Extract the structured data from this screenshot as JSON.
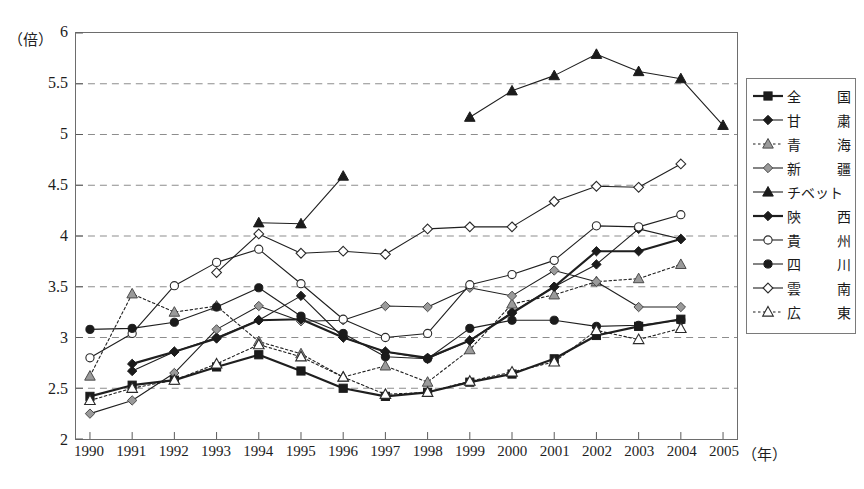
{
  "axis": {
    "y_unit_label": "（倍）",
    "x_unit_label": "（年）",
    "y_ticks": [
      "6",
      "5.5",
      "5",
      "4.5",
      "4",
      "3.5",
      "3",
      "2.5",
      "2"
    ],
    "x_ticks": [
      "1990",
      "1991",
      "1992",
      "1993",
      "1994",
      "1995",
      "1996",
      "1997",
      "1998",
      "1999",
      "2000",
      "2001",
      "2002",
      "2003",
      "2004",
      "2005"
    ]
  },
  "legend": {
    "items": [
      {
        "label": "全　国",
        "chars": [
          "全",
          "国"
        ],
        "marker": "square-filled",
        "dash": "solid",
        "weight": "bold"
      },
      {
        "label": "甘　粛",
        "chars": [
          "甘",
          "粛"
        ],
        "marker": "diamond-filled",
        "dash": "solid",
        "weight": "normal"
      },
      {
        "label": "青　海",
        "chars": [
          "青",
          "海"
        ],
        "marker": "triangle-grey",
        "dash": "dotted",
        "weight": "normal"
      },
      {
        "label": "新　疆",
        "chars": [
          "新",
          "疆"
        ],
        "marker": "diamond-grey",
        "dash": "solid",
        "weight": "normal"
      },
      {
        "label": "チベット",
        "chars": [
          "チベット"
        ],
        "marker": "triangle-filled",
        "dash": "solid",
        "weight": "normal"
      },
      {
        "label": "陝　西",
        "chars": [
          "陝",
          "西"
        ],
        "marker": "diamond-filled",
        "dash": "solid",
        "weight": "bold"
      },
      {
        "label": "貴　州",
        "chars": [
          "貴",
          "州"
        ],
        "marker": "circle-open",
        "dash": "solid",
        "weight": "normal"
      },
      {
        "label": "四　川",
        "chars": [
          "四",
          "川"
        ],
        "marker": "circle-filled",
        "dash": "solid",
        "weight": "normal"
      },
      {
        "label": "雲　南",
        "chars": [
          "雲",
          "南"
        ],
        "marker": "diamond-open",
        "dash": "solid",
        "weight": "normal"
      },
      {
        "label": "広　東",
        "chars": [
          "広",
          "東"
        ],
        "marker": "triangle-open",
        "dash": "dotted",
        "weight": "normal"
      }
    ]
  },
  "chart_data": {
    "type": "line",
    "title": "",
    "xlabel": "（年）",
    "ylabel": "（倍）",
    "xlim": [
      1990,
      2005
    ],
    "ylim": [
      2,
      6
    ],
    "ytick_step": 0.5,
    "grid": "horizontal-dashed",
    "legend_position": "right",
    "x": [
      1990,
      1991,
      1992,
      1993,
      1994,
      1995,
      1996,
      1997,
      1998,
      1999,
      2000,
      2001,
      2002,
      2003,
      2004,
      2005
    ],
    "series": [
      {
        "name": "全国",
        "marker": "square-filled",
        "dash": "solid",
        "weight": "bold",
        "values": [
          2.42,
          2.53,
          2.58,
          2.71,
          2.83,
          2.67,
          2.5,
          2.42,
          2.46,
          2.56,
          2.64,
          2.79,
          3.02,
          3.11,
          3.18,
          null
        ]
      },
      {
        "name": "甘粛",
        "marker": "diamond-filled",
        "dash": "solid",
        "weight": "normal",
        "values": [
          null,
          2.67,
          2.86,
          3.0,
          3.17,
          3.41,
          3.0,
          2.86,
          2.79,
          2.97,
          3.25,
          3.5,
          3.72,
          4.07,
          3.97,
          null
        ]
      },
      {
        "name": "青海",
        "marker": "triangle-grey",
        "dash": "dotted",
        "weight": "normal",
        "values": [
          2.62,
          3.43,
          3.25,
          3.31,
          2.96,
          2.84,
          2.61,
          2.72,
          2.56,
          2.88,
          3.33,
          3.42,
          3.55,
          3.58,
          3.72,
          null
        ]
      },
      {
        "name": "新疆",
        "marker": "diamond-grey",
        "dash": "solid",
        "weight": "normal",
        "values": [
          2.25,
          2.38,
          2.65,
          3.08,
          3.31,
          3.16,
          3.17,
          3.31,
          3.3,
          3.49,
          3.41,
          3.66,
          3.55,
          3.3,
          3.3,
          null
        ]
      },
      {
        "name": "チベット",
        "marker": "triangle-filled",
        "dash": "solid",
        "weight": "normal",
        "values": [
          null,
          null,
          null,
          null,
          4.13,
          4.12,
          4.59,
          null,
          null,
          5.17,
          5.43,
          5.58,
          5.79,
          5.62,
          5.55,
          5.09
        ]
      },
      {
        "name": "陝西",
        "marker": "diamond-filled",
        "dash": "solid",
        "weight": "bold",
        "values": [
          null,
          2.74,
          2.86,
          2.99,
          3.17,
          3.18,
          3.0,
          2.86,
          2.8,
          2.97,
          3.24,
          3.5,
          3.85,
          3.85,
          3.97,
          null
        ]
      },
      {
        "name": "貴州",
        "marker": "circle-open",
        "dash": "solid",
        "weight": "normal",
        "values": [
          2.8,
          3.04,
          3.51,
          3.74,
          3.87,
          3.53,
          3.18,
          3.0,
          3.04,
          3.52,
          3.62,
          3.76,
          4.1,
          4.09,
          4.21,
          null
        ]
      },
      {
        "name": "四川",
        "marker": "circle-filled",
        "dash": "solid",
        "weight": "normal",
        "values": [
          3.08,
          3.09,
          3.15,
          3.3,
          3.49,
          3.21,
          3.04,
          2.81,
          2.79,
          3.09,
          3.17,
          3.17,
          3.11,
          3.12,
          3.17,
          null
        ]
      },
      {
        "name": "雲南",
        "marker": "diamond-open",
        "dash": "solid",
        "weight": "normal",
        "values": [
          null,
          null,
          null,
          3.64,
          4.02,
          3.83,
          3.85,
          3.82,
          4.07,
          4.09,
          4.09,
          4.34,
          4.49,
          4.48,
          4.71,
          null
        ]
      },
      {
        "name": "広東",
        "marker": "triangle-open",
        "dash": "dotted",
        "weight": "normal",
        "values": [
          2.38,
          2.5,
          2.58,
          2.74,
          2.93,
          2.81,
          2.61,
          2.44,
          2.46,
          2.57,
          2.66,
          2.76,
          3.07,
          2.98,
          3.09,
          null
        ]
      }
    ]
  }
}
